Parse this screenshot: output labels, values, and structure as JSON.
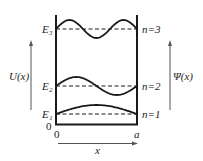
{
  "diagram": {
    "axes": {
      "left_label": "U(x)",
      "right_label": "Ψ(x)",
      "x_label": "x",
      "origin_y_label": "0",
      "origin_x_label": "0",
      "width_label": "a"
    },
    "levels": [
      {
        "energy_label": "E₁",
        "n_label": "n=1",
        "n": 1
      },
      {
        "energy_label": "E₂",
        "n_label": "n=2",
        "n": 2
      },
      {
        "energy_label": "E₃",
        "n_label": "n=3",
        "n": 3
      }
    ],
    "colors": {
      "line": "#1a1a1a",
      "text": "#222222",
      "arrow": "#555555"
    }
  }
}
